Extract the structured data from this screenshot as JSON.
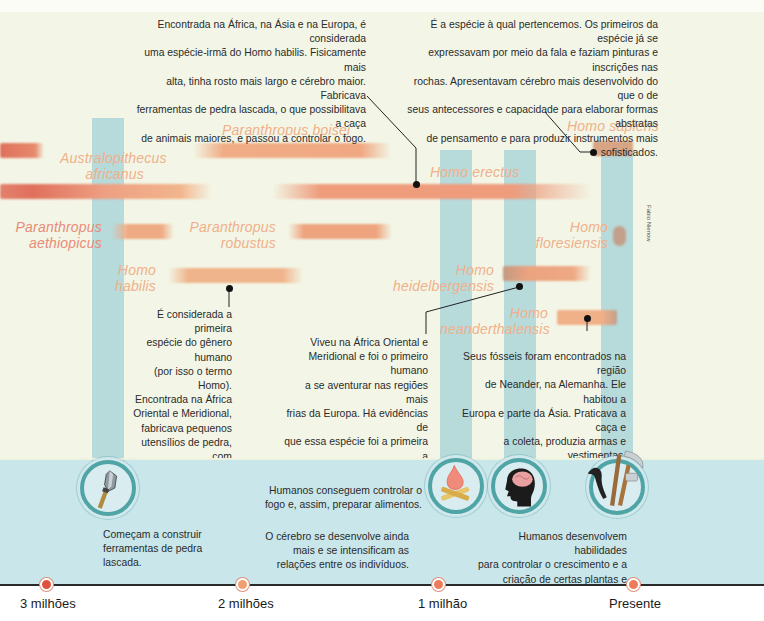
{
  "credit": "Fabio Nienow",
  "colors": {
    "background": "#f3f6e6",
    "bottom_band": "#c9e6ea",
    "blue_stripe": "#96cbd6",
    "bar_orange": "#f0a882",
    "bar_red": "#e0705c",
    "species_text_orange": "#f0b08a",
    "species_text_red": "#e98b78",
    "icon_ring": "#4fa4a6",
    "marker_red": "#e0503c",
    "marker_orange": "#f0a070"
  },
  "species": [
    {
      "name": "Paranthropus boisei",
      "lines": [
        "Paranthropus boisei"
      ]
    },
    {
      "name": "Australopithecus africanus",
      "lines": [
        "Australopithecus",
        "africanus"
      ]
    },
    {
      "name": "Homo erectus",
      "lines": [
        "Homo erectus"
      ]
    },
    {
      "name": "Paranthropus aethiopicus",
      "lines": [
        "Paranthropus",
        "aethiopicus"
      ]
    },
    {
      "name": "Paranthropus robustus",
      "lines": [
        "Paranthropus",
        "robustus"
      ]
    },
    {
      "name": "Homo habilis",
      "lines": [
        "Homo",
        "habilis"
      ]
    },
    {
      "name": "Homo heidelbergensis",
      "lines": [
        "Homo",
        "heidelbergensis"
      ]
    },
    {
      "name": "Homo sapiens",
      "lines": [
        "Homo sapiens"
      ]
    },
    {
      "name": "Homo floresiensis",
      "lines": [
        "Homo",
        "floresiensis"
      ]
    },
    {
      "name": "Homo neanderthalensis",
      "lines": [
        "Homo",
        "neanderthalensis"
      ]
    }
  ],
  "descriptions": {
    "erectus": [
      "Encontrada na África, na Ásia e na Europa, é considerada",
      "uma espécie-irmã do Homo habilis. Fisicamente mais",
      "alta, tinha rosto mais largo e cérebro maior. Fabricava",
      "ferramentas de pedra lascada, o que possibilitava a caça",
      "de animais maiores, e passou a controlar o fogo."
    ],
    "sapiens": [
      "É a espécie à qual pertencemos. Os primeiros da espécie já se",
      "expressavam por meio da fala e faziam pinturas e inscrições nas",
      "rochas. Apresentavam cérebro mais desenvolvido do que o de",
      "seus antecessores e capacidade para elaborar formas abstratas",
      "de pensamento e para produzir instrumentos mais sofisticados."
    ],
    "habilis": [
      "É considerada a primeira",
      "espécie do gênero humano",
      "(por isso o termo Homo).",
      "Encontrada na África",
      "Oriental e Meridional,",
      "fabricava pequenos",
      "utensílios de pedra, com",
      "os quais caçava animais",
      "de pequeno porte."
    ],
    "heidelbergensis": [
      "Viveu na África Oriental e",
      "Meridional e foi o primeiro humano",
      "a se aventurar nas regiões mais",
      "frias da Europa. Há evidências de",
      "que essa espécie foi a primeira a",
      "fazer abrigos e a caçar grandes",
      "animais com lanças de madeira."
    ],
    "neanderthalensis": [
      "Seus fósseis foram encontrados na região",
      "de Neander, na Alemanha. Ele habitou a",
      "Europa e parte da Ásia. Praticava a caça e",
      "a coleta, produzia armas e vestimentas,",
      "construía cabanas e realizava rituais de",
      "sepultamento."
    ]
  },
  "milestones": [
    {
      "icon": "stone-tool-icon",
      "lines": [
        "Começam a construir",
        "ferramentas de pedra",
        "lascada."
      ]
    },
    {
      "icon": "campfire-icon",
      "lines": [
        "Humanos conseguem controlar o",
        "fogo e, assim, preparar alimentos."
      ]
    },
    {
      "icon": "brain-head-icon",
      "lines": [
        "O cérebro se desenvolve ainda",
        "mais e se intensificam as",
        "relações entre os indivíduos."
      ]
    },
    {
      "icon": "farming-tools-icon",
      "lines": [
        "Humanos desenvolvem habilidades",
        "para controlar o crescimento e a",
        "criação de certas plantas e animais."
      ]
    }
  ],
  "timeline": {
    "ticks": [
      {
        "label": "3 milhões",
        "color": "#e0503c"
      },
      {
        "label": "2 milhões",
        "color": "#f0a070"
      },
      {
        "label": "1 milhão",
        "color": "#ec7c5a"
      },
      {
        "label": "Presente",
        "color": "#ec7c5a"
      }
    ]
  }
}
